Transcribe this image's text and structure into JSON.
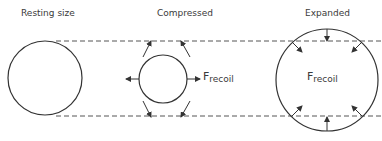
{
  "diagram": {
    "panels": [
      {
        "id": "resting",
        "title": "Resting size"
      },
      {
        "id": "compressed",
        "title": "Compressed",
        "force_label": {
          "main": "F",
          "sub": "recoil"
        }
      },
      {
        "id": "expanded",
        "title": "Expanded",
        "force_label": {
          "main": "F",
          "sub": "recoil"
        }
      }
    ],
    "colors": {
      "stroke": "#333333",
      "dash": "#555555",
      "text": "#3a3a3a"
    }
  }
}
